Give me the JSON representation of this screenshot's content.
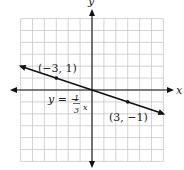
{
  "chart_data": {
    "type": "line",
    "title": "",
    "xlabel": "x",
    "ylabel": "y",
    "xlim": [
      -6,
      6
    ],
    "ylim": [
      -6,
      6
    ],
    "grid": true,
    "grid_step": 1,
    "series": [
      {
        "name": "y = -1/3 x",
        "slope": -0.3333,
        "intercept": 0,
        "x": [
          -6,
          6
        ],
        "y": [
          2,
          -2
        ],
        "arrows": "both"
      }
    ],
    "points": [
      {
        "x": -3,
        "y": 1,
        "label": "(−3, 1)"
      },
      {
        "x": 3,
        "y": -1,
        "label": "(3, −1)"
      }
    ],
    "annotations": {
      "equation_lhs": "y = −",
      "equation_num": "1",
      "equation_den": "3",
      "equation_var": "x"
    },
    "colors": {
      "grid": "#c8c8c8",
      "axis": "#111111",
      "line": "#111111"
    }
  }
}
